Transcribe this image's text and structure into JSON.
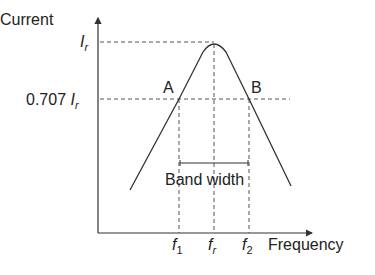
{
  "diagram": {
    "type": "resonance-curve",
    "y_axis_label": "Current",
    "x_axis_label": "Frequency",
    "y_ticks": [
      {
        "label_main": "I",
        "label_sub": "r",
        "prefix": ""
      },
      {
        "label_main": "I",
        "label_sub": "r",
        "prefix": "0.707 "
      }
    ],
    "x_ticks": [
      {
        "main": "f",
        "sub": "1"
      },
      {
        "main": "f",
        "sub": "r"
      },
      {
        "main": "f",
        "sub": "2"
      }
    ],
    "points": [
      {
        "name": "A"
      },
      {
        "name": "B"
      }
    ],
    "bandwidth_label": "Band width",
    "colors": {
      "line": "#333333",
      "dash": "#555555",
      "text": "#222222"
    }
  }
}
